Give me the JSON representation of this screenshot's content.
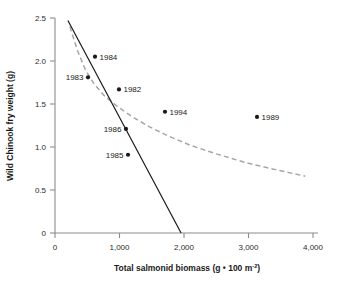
{
  "chart_data": {
    "type": "scatter",
    "title": "",
    "xlabel": "Total salmonid biomass (g • 100 m⁻²)",
    "ylabel": "Wild Chinook fry weight (g)",
    "xlim": [
      0,
      4000
    ],
    "ylim": [
      0,
      2.5
    ],
    "grid": false,
    "legend": "none",
    "xticks": [
      0,
      1000,
      2000,
      3000,
      4000
    ],
    "xtick_labels": [
      "0",
      "1,000",
      "2,000",
      "3,000",
      "4,000"
    ],
    "yticks": [
      0,
      0.5,
      1.0,
      1.5,
      2.0,
      2.5
    ],
    "ytick_labels": [
      "0",
      "0.5",
      "1.0",
      "1.5",
      "2.0",
      "2.5"
    ],
    "points": [
      {
        "label": "1983",
        "x": 512,
        "y": 1.81,
        "label_side": "left"
      },
      {
        "label": "1984",
        "x": 620,
        "y": 2.05,
        "label_side": "right"
      },
      {
        "label": "1982",
        "x": 992,
        "y": 1.67,
        "label_side": "right"
      },
      {
        "label": "1986",
        "x": 1100,
        "y": 1.21,
        "label_side": "left"
      },
      {
        "label": "1985",
        "x": 1132,
        "y": 0.91,
        "label_side": "left"
      },
      {
        "label": "1994",
        "x": 1705,
        "y": 1.41,
        "label_side": "right"
      },
      {
        "label": "1989",
        "x": 3132,
        "y": 1.35,
        "label_side": "right"
      }
    ],
    "series": [
      {
        "name": "linear-fit",
        "type": "line",
        "style": "solid",
        "color": "#1a1a1a",
        "points": [
          [
            200,
            2.47
          ],
          [
            1955,
            0.0
          ]
        ]
      },
      {
        "name": "curve-fit",
        "type": "line",
        "style": "dashed",
        "color": "#a6a6a6",
        "points": [
          [
            230,
            2.4
          ],
          [
            350,
            2.12
          ],
          [
            470,
            1.9
          ],
          [
            600,
            1.74
          ],
          [
            760,
            1.6
          ],
          [
            950,
            1.48
          ],
          [
            1180,
            1.36
          ],
          [
            1450,
            1.24
          ],
          [
            1750,
            1.13
          ],
          [
            2100,
            1.02
          ],
          [
            2500,
            0.92
          ],
          [
            2950,
            0.82
          ],
          [
            3400,
            0.74
          ],
          [
            3880,
            0.66
          ]
        ]
      }
    ],
    "colors": {
      "axis": "#8c8c8c",
      "point": "#1a1a1a",
      "text": "#1a1a1a",
      "solid_line": "#1a1a1a",
      "dashed_line": "#a6a6a6"
    }
  }
}
